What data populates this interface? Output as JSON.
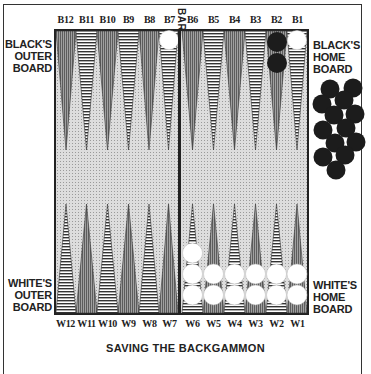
{
  "title": "SAVING THE BACKGAMMON",
  "labels": {
    "black_outer": [
      "BLACK'S",
      "OUTER",
      "BOARD"
    ],
    "black_home": [
      "BLACK'S",
      "HOME",
      "BOARD"
    ],
    "white_outer": [
      "WHITE'S",
      "OUTER",
      "BOARD"
    ],
    "white_home": [
      "WHITE'S",
      "HOME",
      "BOARD"
    ],
    "bar": "BAR"
  },
  "top_points": [
    "B12",
    "B11",
    "B10",
    "B9",
    "B8",
    "B7",
    "B6",
    "B5",
    "B4",
    "B3",
    "B2",
    "B1"
  ],
  "bottom_points": [
    "W12",
    "W11",
    "W10",
    "W9",
    "W8",
    "W7",
    "W6",
    "W5",
    "W4",
    "W3",
    "W2",
    "W1"
  ],
  "position": {
    "B7": {
      "color": "white",
      "count": 1
    },
    "B2": {
      "color": "black",
      "count": 2
    },
    "B1": {
      "color": "white",
      "count": 1
    },
    "W6": {
      "color": "white",
      "count": 3
    },
    "W5": {
      "color": "white",
      "count": 2
    },
    "W4": {
      "color": "white",
      "count": 2
    },
    "W3": {
      "color": "white",
      "count": 2
    },
    "W2": {
      "color": "white",
      "count": 2
    },
    "W1": {
      "color": "white",
      "count": 2
    },
    "black_borne_off": 13
  },
  "colors": {
    "ink": "#222222",
    "board_bg": "#dddddd",
    "dark_point": "#8a8a8a",
    "black_checker": "#1c1c1c",
    "white_checker": "#ffffff"
  }
}
